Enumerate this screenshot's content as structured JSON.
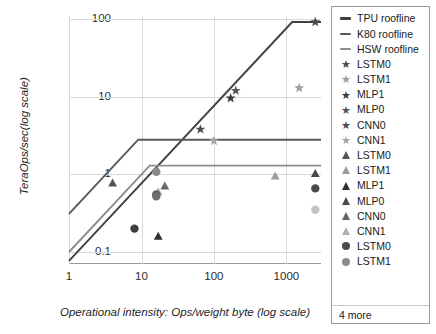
{
  "chart_data": {
    "type": "line",
    "title": "",
    "xlabel": "Operational intensity: Ops/weight byte (log scale)",
    "ylabel": "TeraOps/sec(log scale)",
    "xscale": "log",
    "yscale": "log",
    "xlim": [
      1,
      3000
    ],
    "ylim": [
      0.07,
      110
    ],
    "xticks": [
      "1",
      "10",
      "100",
      "1000"
    ],
    "xtick_values": [
      1,
      10,
      100,
      1000
    ],
    "yticks": [
      "0.1",
      "1",
      "10",
      "100"
    ],
    "ytick_values": [
      0.1,
      1,
      10,
      100
    ],
    "grid": true,
    "legend_position": "right",
    "rooflines": [
      {
        "name": "TPU roofline",
        "color": "#404040",
        "ridge_x": 1200,
        "peak_y": 92,
        "points": [
          [
            1,
            0.077
          ],
          [
            1200,
            92
          ],
          [
            3000,
            92
          ]
        ]
      },
      {
        "name": "K80 roofline",
        "color": "#585858",
        "ridge_x": 9,
        "peak_y": 2.8,
        "points": [
          [
            1,
            0.31
          ],
          [
            9,
            2.8
          ],
          [
            3000,
            2.8
          ]
        ]
      },
      {
        "name": "HSW roofline",
        "color": "#8d8d8d",
        "ridge_x": 13,
        "peak_y": 1.3,
        "points": [
          [
            1,
            0.1
          ],
          [
            13,
            1.3
          ],
          [
            3000,
            1.3
          ]
        ]
      }
    ],
    "series": [
      {
        "name": "LSTM0",
        "marker": "star",
        "color": "#4a4a4a",
        "platform": "TPU",
        "points": [
          [
            2500,
            92
          ]
        ]
      },
      {
        "name": "LSTM1",
        "marker": "star",
        "color": "#9e9e9e",
        "platform": "TPU",
        "points": [
          [
            1500,
            13
          ]
        ]
      },
      {
        "name": "MLP1",
        "marker": "star",
        "color": "#3a3a3a",
        "platform": "TPU",
        "points": [
          [
            170,
            9.6
          ]
        ]
      },
      {
        "name": "MLP0",
        "marker": "star",
        "color": "#555555",
        "platform": "TPU",
        "points": [
          [
            200,
            12
          ]
        ]
      },
      {
        "name": "CNN0",
        "marker": "star",
        "color": "#4f4f4f",
        "platform": "TPU",
        "points": [
          [
            65,
            3.8
          ]
        ]
      },
      {
        "name": "CNN1",
        "marker": "star",
        "color": "#a5a5a5",
        "platform": "TPU",
        "points": [
          [
            100,
            2.7
          ]
        ]
      },
      {
        "name": "LSTM0",
        "marker": "triangle",
        "color": "#555555",
        "platform": "HSW",
        "points": [
          [
            4,
            0.78
          ]
        ]
      },
      {
        "name": "LSTM1",
        "marker": "triangle",
        "color": "#9c9c9c",
        "platform": "HSW",
        "points": [
          [
            700,
            0.96
          ]
        ]
      },
      {
        "name": "MLP1",
        "marker": "triangle",
        "color": "#2f2f2f",
        "platform": "HSW",
        "points": [
          [
            17,
            0.16
          ]
        ]
      },
      {
        "name": "MLP0",
        "marker": "triangle",
        "color": "#4a4a4a",
        "platform": "HSW",
        "points": [
          [
            2500,
            1.03
          ]
        ]
      },
      {
        "name": "CNN0",
        "marker": "triangle",
        "color": "#666666",
        "platform": "HSW",
        "points": [
          [
            21,
            0.71
          ]
        ]
      },
      {
        "name": "CNN1",
        "marker": "triangle",
        "color": "#b0b0b0",
        "platform": "HSW",
        "points": [
          [
            17,
            0.6
          ]
        ]
      },
      {
        "name": "LSTM0",
        "marker": "circle",
        "color": "#4a4a4a",
        "platform": "K80",
        "points": [
          [
            2500,
            0.66
          ]
        ]
      },
      {
        "name": "LSTM1",
        "marker": "circle",
        "color": "#8a8a8a",
        "platform": "K80",
        "points": [
          [
            16,
            1.08
          ]
        ]
      },
      {
        "name": "MLP1",
        "marker": "circle",
        "color": "#3d3d3d",
        "platform": "K80",
        "points": [
          [
            8,
            0.2
          ]
        ]
      },
      {
        "name": "MLP0",
        "marker": "circle",
        "color": "#5a5a5a",
        "platform": "K80",
        "points": [
          [
            16,
            0.55
          ]
        ]
      },
      {
        "name": "CNN0",
        "marker": "circle",
        "color": "#6e6e6e",
        "platform": "K80",
        "points": [
          [
            16,
            0.52
          ]
        ]
      },
      {
        "name": "CNN1",
        "marker": "circle",
        "color": "#c4c4c4",
        "platform": "K80",
        "points": [
          [
            2500,
            0.35
          ]
        ]
      }
    ]
  },
  "axes": {
    "x_title": "Operational intensity: Ops/weight byte (log scale)",
    "y_title": "TeraOps/sec(log scale)",
    "x_ticks": [
      "1",
      "10",
      "100",
      "1000"
    ],
    "y_ticks": [
      "100",
      "10",
      "1",
      "0.1"
    ]
  },
  "legend": {
    "more_label": "4 more",
    "items": [
      {
        "label": "TPU roofline",
        "marker": "line",
        "color": "#404040"
      },
      {
        "label": "K80 roofline",
        "marker": "line",
        "color": "#585858"
      },
      {
        "label": "HSW roofline",
        "marker": "line",
        "color": "#8d8d8d"
      },
      {
        "label": "LSTM0",
        "marker": "star",
        "color": "#4a4a4a"
      },
      {
        "label": "LSTM1",
        "marker": "star",
        "color": "#9e9e9e"
      },
      {
        "label": "MLP1",
        "marker": "star",
        "color": "#3a3a3a"
      },
      {
        "label": "MLP0",
        "marker": "star",
        "color": "#555555"
      },
      {
        "label": "CNN0",
        "marker": "star",
        "color": "#4f4f4f"
      },
      {
        "label": "CNN1",
        "marker": "star",
        "color": "#a5a5a5"
      },
      {
        "label": "LSTM0",
        "marker": "triangle",
        "color": "#555555"
      },
      {
        "label": "LSTM1",
        "marker": "triangle",
        "color": "#9c9c9c"
      },
      {
        "label": "MLP1",
        "marker": "triangle",
        "color": "#2f2f2f"
      },
      {
        "label": "MLP0",
        "marker": "triangle",
        "color": "#4a4a4a"
      },
      {
        "label": "CNN0",
        "marker": "triangle",
        "color": "#666666"
      },
      {
        "label": "CNN1",
        "marker": "triangle",
        "color": "#b0b0b0"
      },
      {
        "label": "LSTM0",
        "marker": "circle",
        "color": "#4a4a4a"
      },
      {
        "label": "LSTM1",
        "marker": "circle",
        "color": "#8a8a8a"
      }
    ]
  }
}
